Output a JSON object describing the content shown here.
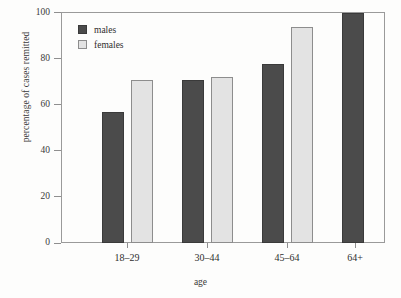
{
  "chart_data": {
    "type": "bar",
    "title": "",
    "subtitle": "",
    "xlabel": "age",
    "ylabel": "percentage of cases remitted",
    "categories": [
      "18–29",
      "30–44",
      "45–64",
      "64+"
    ],
    "series": [
      {
        "name": "males",
        "color": "#4b4b4b",
        "values": [
          57,
          71,
          78,
          100
        ]
      },
      {
        "name": "females",
        "color": "#e3e3e3",
        "values": [
          71,
          72,
          94,
          null
        ]
      }
    ],
    "ylim": [
      0,
      100
    ],
    "yticks": [
      0,
      20,
      40,
      60,
      80,
      100
    ],
    "ytick_labels": [
      "0",
      "20",
      "40",
      "60",
      "80",
      "100"
    ],
    "grid": false,
    "legend_position": "top-left-inside",
    "legend": [
      {
        "label": "males",
        "swatch": "males"
      },
      {
        "label": "females",
        "swatch": "females"
      }
    ]
  }
}
